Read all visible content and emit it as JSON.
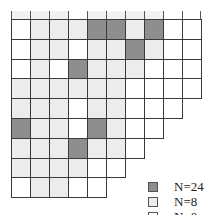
{
  "diagram": {
    "type": "staircase-grid",
    "cell_size_px": 19,
    "colors": {
      "G": "#8e8e8e",
      "L": "#ececec",
      "W": "#ffffff"
    },
    "top_strip": [
      "L",
      "L",
      "L",
      "W",
      "L",
      "L",
      "L",
      "L",
      "W",
      "W"
    ],
    "rows": [
      [
        "W",
        "L",
        "L",
        "L",
        "G",
        "G",
        "L",
        "G",
        "W",
        "W"
      ],
      [
        "W",
        "L",
        "L",
        "W",
        "L",
        "L",
        "G",
        "L",
        "W",
        "W"
      ],
      [
        "W",
        "L",
        "W",
        "G",
        "L",
        "L",
        "L",
        "W",
        "W",
        "W"
      ],
      [
        "L",
        "L",
        "L",
        "L",
        "L",
        "L",
        "W",
        "W",
        "W",
        "W"
      ],
      [
        "L",
        "L",
        "L",
        "W",
        "L",
        "L",
        "W",
        "W",
        "W"
      ],
      [
        "G",
        "L",
        "L",
        "W",
        "G",
        "L",
        "W",
        "W"
      ],
      [
        "L",
        "L",
        "L",
        "G",
        "L",
        "L",
        "W"
      ],
      [
        "L",
        "L",
        "L",
        "L",
        "W",
        "W"
      ],
      [
        "W",
        "L",
        "L",
        "W",
        "W"
      ]
    ]
  },
  "legend": {
    "items": [
      {
        "key": "G",
        "label": "N=24"
      },
      {
        "key": "L",
        "label": "N=8"
      },
      {
        "key": "W",
        "label": "N=0"
      }
    ]
  }
}
